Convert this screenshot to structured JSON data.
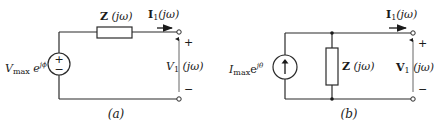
{
  "figure": {
    "circuit_a": {
      "caption": "(a)",
      "source": {
        "type": "voltage-source",
        "label_main": "V",
        "label_sub": "max",
        "label_exp": " e",
        "label_sup": "jϕ",
        "plus": "+",
        "minus": "−"
      },
      "impedance": {
        "label_bold": "Z",
        "label_arg": " (jω)",
        "connection": "series"
      },
      "current": {
        "label_bold": "I",
        "label_sub": "1",
        "label_arg": "(jω)"
      },
      "output_voltage": {
        "label_main": "V",
        "label_sub": "1",
        "label_arg": " (jω)",
        "plus": "+",
        "minus": "−"
      }
    },
    "circuit_b": {
      "caption": "(b)",
      "source": {
        "type": "current-source",
        "label_main": "I",
        "label_sub": "max",
        "label_exp": "e",
        "label_sup": "jθ"
      },
      "impedance": {
        "label_bold": "Z",
        "label_arg": " (jω)",
        "connection": "shunt"
      },
      "current": {
        "label_bold": "I",
        "label_sub": "1",
        "label_arg": "(jω)"
      },
      "output_voltage": {
        "label_bold": "V",
        "label_sub": "1",
        "label_arg": " (jω)",
        "plus": "+",
        "minus": "−"
      }
    },
    "colors": {
      "line": "#2a2a2a",
      "background": "#ffffff"
    }
  }
}
